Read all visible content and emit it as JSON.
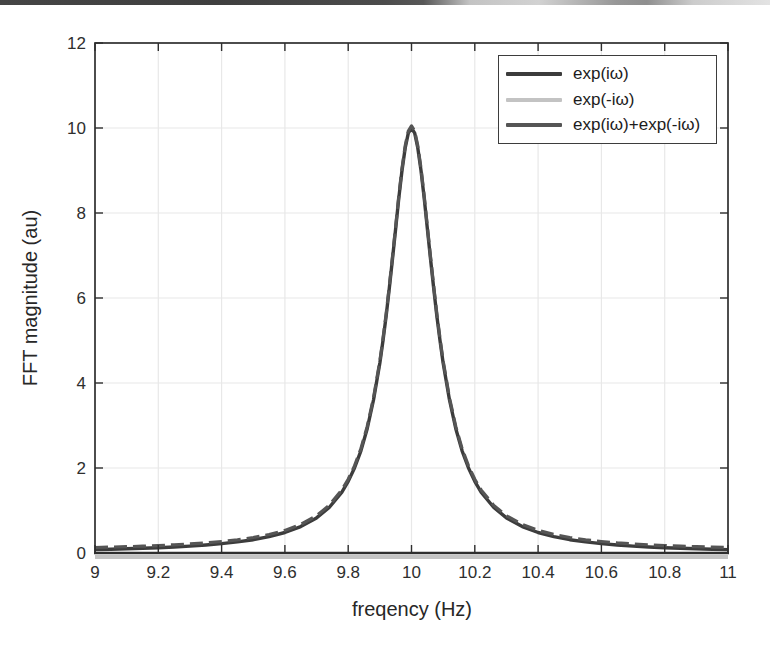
{
  "figure": {
    "background_color": "#ffffff",
    "scan_artifact_bar": {
      "description": "dark-scan-edge",
      "color_left": "#3f3f3f",
      "color_right": "#d9d9d9"
    }
  },
  "chart_data": {
    "type": "line",
    "title": "",
    "xlabel": "freqency (Hz)",
    "ylabel": "FFT magnitude (au)",
    "xlim": [
      9,
      11
    ],
    "ylim": [
      0,
      12
    ],
    "grid": true,
    "grid_color": "#e8e8e8",
    "axis_color": "#2e2e2e",
    "legend_position": "top-right",
    "xtick_values": [
      9,
      9.2,
      9.4,
      9.6,
      9.8,
      10,
      10.2,
      10.4,
      10.6,
      10.8,
      11
    ],
    "xtick_labels": [
      "9",
      "9.2",
      "9.4",
      "9.6",
      "9.8",
      "10",
      "10.2",
      "10.4",
      "10.6",
      "10.8",
      "11"
    ],
    "ytick_values": [
      0,
      2,
      4,
      6,
      8,
      10,
      12
    ],
    "ytick_labels": [
      "0",
      "2",
      "4",
      "6",
      "8",
      "10",
      "12"
    ],
    "peak": {
      "center_hz": 10,
      "height_au": 10
    },
    "x": [
      9.0,
      9.05,
      9.1,
      9.15,
      9.2,
      9.25,
      9.3,
      9.35,
      9.4,
      9.45,
      9.5,
      9.55,
      9.6,
      9.65,
      9.7,
      9.74,
      9.78,
      9.8,
      9.82,
      9.84,
      9.86,
      9.88,
      9.9,
      9.91,
      9.92,
      9.93,
      9.94,
      9.95,
      9.96,
      9.97,
      9.98,
      9.99,
      10.0,
      10.01,
      10.02,
      10.03,
      10.04,
      10.05,
      10.06,
      10.07,
      10.08,
      10.09,
      10.1,
      10.12,
      10.14,
      10.16,
      10.18,
      10.2,
      10.22,
      10.26,
      10.3,
      10.35,
      10.4,
      10.45,
      10.5,
      10.55,
      10.6,
      10.65,
      10.7,
      10.75,
      10.8,
      10.85,
      10.9,
      10.95,
      11.0
    ],
    "series": [
      {
        "name": "exp(iω)",
        "color": "#3c3c3c",
        "values": [
          0.08,
          0.089,
          0.099,
          0.111,
          0.125,
          0.142,
          0.163,
          0.188,
          0.22,
          0.261,
          0.314,
          0.385,
          0.482,
          0.62,
          0.826,
          1.07,
          1.434,
          1.684,
          2.0,
          2.404,
          2.924,
          3.6,
          4.475,
          5.0,
          5.586,
          6.231,
          6.923,
          7.642,
          8.351,
          9.0,
          9.529,
          9.878,
          10.0,
          9.878,
          9.529,
          9.0,
          8.351,
          7.642,
          6.923,
          6.231,
          5.586,
          5.0,
          4.475,
          3.6,
          2.924,
          2.404,
          2.0,
          1.684,
          1.434,
          1.07,
          0.826,
          0.62,
          0.482,
          0.385,
          0.314,
          0.261,
          0.22,
          0.188,
          0.163,
          0.142,
          0.125,
          0.111,
          0.099,
          0.089,
          0.08
        ]
      },
      {
        "name": "exp(-iω)",
        "color": "#c3c3c3",
        "x": [
          9.0,
          11.0
        ],
        "values": [
          0.05,
          0.05
        ]
      },
      {
        "name": "exp(iω)+exp(-iω)",
        "color": "#555555",
        "values": [
          0.13,
          0.139,
          0.149,
          0.161,
          0.175,
          0.192,
          0.213,
          0.238,
          0.27,
          0.311,
          0.364,
          0.435,
          0.532,
          0.67,
          0.876,
          1.12,
          1.484,
          1.734,
          2.05,
          2.454,
          2.974,
          3.65,
          4.525,
          5.05,
          5.636,
          6.281,
          6.973,
          7.692,
          8.401,
          9.05,
          9.579,
          9.928,
          10.05,
          9.928,
          9.579,
          9.05,
          8.401,
          7.692,
          6.973,
          6.281,
          5.636,
          5.05,
          4.525,
          3.65,
          2.974,
          2.454,
          2.05,
          1.734,
          1.484,
          1.12,
          0.876,
          0.67,
          0.532,
          0.435,
          0.364,
          0.311,
          0.27,
          0.238,
          0.213,
          0.192,
          0.175,
          0.161,
          0.149,
          0.139,
          0.13
        ]
      }
    ]
  }
}
